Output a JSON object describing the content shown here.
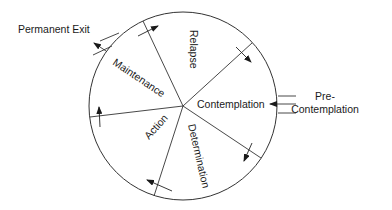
{
  "diagram": {
    "stages": [
      {
        "id": "relapse",
        "label": "Relapse"
      },
      {
        "id": "contemplation",
        "label": "Contemplation"
      },
      {
        "id": "determination",
        "label": "Determination"
      },
      {
        "id": "action",
        "label": "Action"
      },
      {
        "id": "maintenance",
        "label": "Maintenance"
      }
    ],
    "entry": {
      "label_line1": "Pre-",
      "label_line2": "Contemplation"
    },
    "exit": {
      "label": "Permanent Exit"
    },
    "colors": {
      "stroke": "#333333",
      "text": "#1a1a1a",
      "background": "#ffffff"
    }
  }
}
